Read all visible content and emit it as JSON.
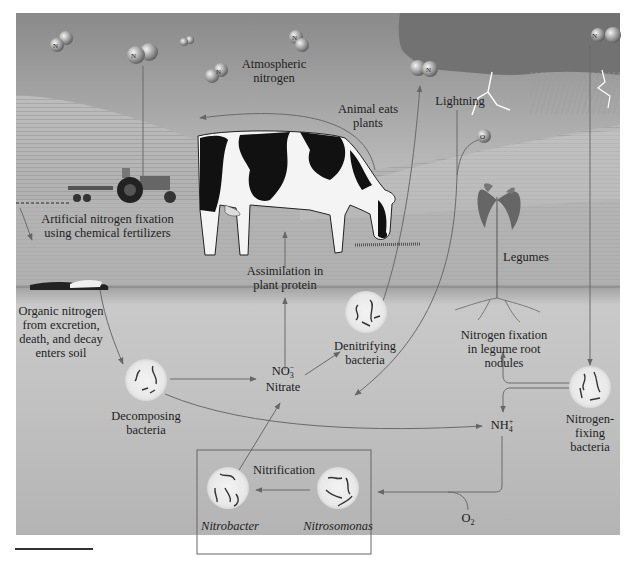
{
  "figure": {
    "colors": {
      "sky_top": "#8e8e8e",
      "sky_bottom": "#d2d2d2",
      "soil": "#b5b5b5",
      "cloud": "#6f6f6f",
      "bacteria_circle": "#ececec",
      "arrow": "#6a6a6a",
      "box_border": "#666666"
    }
  },
  "molecules": {
    "n2_label": "N",
    "n2_sub": "2",
    "o2_label": "O",
    "o2_sub": "2"
  },
  "labels": {
    "atmospheric_nitrogen": [
      "Atmospheric",
      "nitrogen"
    ],
    "animal_eats_plants": [
      "Animal eats",
      "plants"
    ],
    "lightning": "Lightning",
    "artificial_fixation": [
      "Artificial nitrogen fixation",
      "using chemical fertilizers"
    ],
    "assimilation": [
      "Assimilation in",
      "plant protein"
    ],
    "legumes": "Legumes",
    "organic_nitrogen": [
      "Organic nitrogen",
      "from excretion,",
      "death, and decay",
      "enters soil"
    ],
    "denitrifying_bacteria": [
      "Denitrifying",
      "bacteria"
    ],
    "nitrogen_fixation_nodules": [
      "Nitrogen fixation",
      "in legume root",
      "nodules"
    ],
    "decomposing_bacteria": [
      "Decomposing",
      "bacteria"
    ],
    "nitrate_formula": "NO",
    "nitrate_sub": "3",
    "nitrate_sup": "−",
    "nitrate_name": "Nitrate",
    "ammonium_formula": "NH",
    "ammonium_sub": "4",
    "ammonium_sup": "+",
    "nitrogen_fixing_bacteria": [
      "Nitrogen-",
      "fixing",
      "bacteria"
    ],
    "nitrification": "Nitrification",
    "nitrobacter": "Nitrobacter",
    "nitrosomonas": "Nitrosomonas",
    "o2_soil": "O",
    "o2_soil_sub": "2"
  }
}
